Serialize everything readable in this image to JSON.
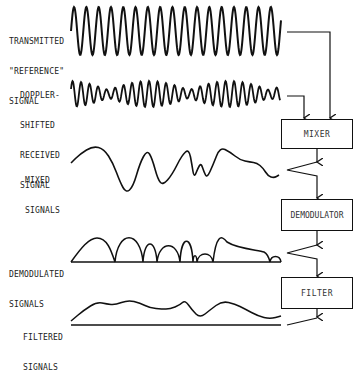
{
  "labels": {
    "transmitted": [
      "TRANSMITTED",
      "\"REFERENCE\"",
      "SIGNAL"
    ],
    "doppler": [
      "DOPPLER-",
      "SHIFTED",
      "RECEIVED",
      "SIGNAL"
    ],
    "mixed": [
      "MIXED",
      "SIGNALS"
    ],
    "demodulated": [
      "DEMODULATED",
      "SIGNALS"
    ],
    "filtered": [
      "FILTERED",
      "SIGNALS"
    ]
  },
  "blocks": {
    "mixer": "MIXER",
    "demodulator": "DEMODULATOR",
    "filter": "FILTER"
  },
  "colors": {
    "stroke": "#111111",
    "background": "#ffffff",
    "text": "#222222"
  },
  "waveforms": {
    "transmitted": {
      "x_start": 71,
      "x_end": 281,
      "center_y": 31,
      "amplitude": 24,
      "period": 12.3
    },
    "doppler": {
      "x_start": 71,
      "x_end": 280,
      "center_y": 94,
      "amplitude_modulated": true,
      "period": 8.5
    },
    "mixed_points": [
      [
        71,
        163
      ],
      [
        80,
        154
      ],
      [
        93,
        146
      ],
      [
        104,
        149
      ],
      [
        113,
        163
      ],
      [
        120,
        182
      ],
      [
        126,
        193
      ],
      [
        133,
        187
      ],
      [
        140,
        163
      ],
      [
        147,
        150
      ],
      [
        152,
        158
      ],
      [
        158,
        180
      ],
      [
        163,
        185
      ],
      [
        172,
        175
      ],
      [
        182,
        155
      ],
      [
        189,
        149
      ],
      [
        192,
        165
      ],
      [
        194,
        178
      ],
      [
        198,
        168
      ],
      [
        201,
        163
      ],
      [
        204,
        172
      ],
      [
        207,
        178
      ],
      [
        213,
        165
      ],
      [
        220,
        147
      ],
      [
        230,
        152
      ],
      [
        240,
        160
      ],
      [
        250,
        162
      ],
      [
        257,
        163
      ],
      [
        263,
        168
      ],
      [
        268,
        176
      ],
      [
        274,
        178
      ],
      [
        279,
        175
      ]
    ],
    "filtered_points": [
      [
        71,
        321
      ],
      [
        84,
        310
      ],
      [
        97,
        302
      ],
      [
        107,
        304
      ],
      [
        115,
        305
      ],
      [
        128,
        300
      ],
      [
        140,
        303
      ],
      [
        150,
        308
      ],
      [
        162,
        309
      ],
      [
        170,
        309
      ],
      [
        180,
        305
      ],
      [
        185,
        300
      ],
      [
        192,
        310
      ],
      [
        200,
        318
      ],
      [
        210,
        310
      ],
      [
        222,
        301
      ],
      [
        235,
        304
      ],
      [
        245,
        309
      ],
      [
        258,
        316
      ],
      [
        270,
        319
      ],
      [
        281,
        316
      ]
    ]
  }
}
